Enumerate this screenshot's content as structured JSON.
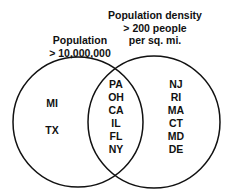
{
  "diagram": {
    "type": "venn",
    "sets": [
      {
        "title_line1": "Population",
        "title_line2": "> 10,000,000",
        "only_members": [
          "MI",
          "TX"
        ]
      },
      {
        "title_line1": "Population density",
        "title_line2": "> 200 people",
        "title_line3": "per sq. mi.",
        "only_members": [
          "NJ",
          "RI",
          "MA",
          "CT",
          "MD",
          "DE"
        ]
      }
    ],
    "intersection": [
      "PA",
      "OH",
      "CA",
      "IL",
      "FL",
      "NY"
    ]
  },
  "colors": {
    "stroke": "#111111",
    "background": "#ffffff"
  }
}
